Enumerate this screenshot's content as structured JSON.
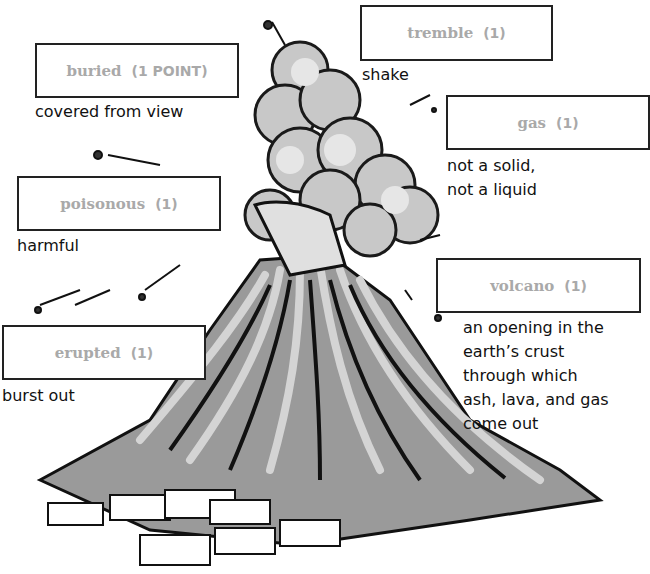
{
  "worksheet": {
    "illustration": "volcano-erupting-over-town",
    "colors": {
      "box_border": "#222222",
      "answer_text": "#a9a9a9",
      "definition_text": "#111111",
      "ink": "#1a1a1a",
      "lava": "#b8b8b8",
      "ash": "#c8c8c8"
    },
    "items": [
      {
        "id": "buried",
        "answer": "buried",
        "points": "(1 POINT)",
        "definition": [
          "covered from view"
        ]
      },
      {
        "id": "tremble",
        "answer": "tremble",
        "points": "(1)",
        "definition": [
          "shake"
        ]
      },
      {
        "id": "gas",
        "answer": "gas",
        "points": "(1)",
        "definition": [
          "not a solid,",
          "not a liquid"
        ]
      },
      {
        "id": "poisonous",
        "answer": "poisonous",
        "points": "(1)",
        "definition": [
          "harmful"
        ]
      },
      {
        "id": "volcano",
        "answer": "volcano",
        "points": "(1)",
        "definition": [
          "an opening in the",
          "earth’s crust",
          "through which",
          "ash, lava, and gas",
          "come out"
        ]
      },
      {
        "id": "erupted",
        "answer": "erupted",
        "points": "(1)",
        "definition": [
          "burst out"
        ]
      }
    ]
  }
}
